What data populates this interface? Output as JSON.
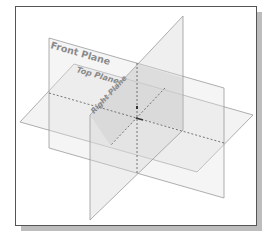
{
  "diagram": {
    "labels": {
      "front_plane": "Front Plane",
      "top_plane": "Top Plane",
      "right_plane": "Right Plane"
    },
    "colors": {
      "plane_edge": "#9a9a9a",
      "plane_fill": "#e8e8e8",
      "axis_dash": "#555555",
      "label": "#8a8a8a",
      "frame_border": "#555555",
      "shadow": "#bdbdbd"
    }
  }
}
